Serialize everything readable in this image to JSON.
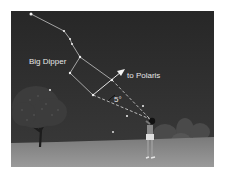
{
  "figure": {
    "labels": {
      "constellation": "Big Dipper",
      "direction": "to Polaris",
      "angle": "5°"
    },
    "colors": {
      "sky": "#2a2a2a",
      "ground": "#8c8c8c",
      "star": "#f2f2f2",
      "line": "#d9d9d9",
      "text": "#e6e6e6"
    }
  }
}
